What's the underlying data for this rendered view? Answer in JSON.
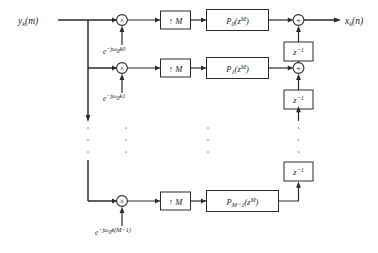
{
  "figure": {
    "type": "block-diagram",
    "domain": "signal-processing"
  },
  "signals": {
    "input_label": "yₖ(m)",
    "input_base": "y",
    "input_sub": "k",
    "input_arg": "(m)",
    "output_label": "xₖ(n)",
    "output_base": "x",
    "output_sub": "k",
    "output_arg": "(n)"
  },
  "branches": [
    {
      "index": 0,
      "modulator_symbol": "×",
      "modulator_label": "multiplier",
      "exponent_base": "e",
      "exponent_label": "−jω₀k0",
      "exp_prefix": "−jω",
      "exp_omega_sub": "0",
      "exp_suffix": "k0",
      "upsampler_label": "↑ M",
      "filter_base": "P",
      "filter_sub": "0",
      "filter_arg_base": "(z",
      "filter_arg_sup": "M",
      "filter_arg_close": ")",
      "filter_label": "P₀(zᴹ)"
    },
    {
      "index": 1,
      "modulator_symbol": "×",
      "modulator_label": "multiplier",
      "exponent_base": "e",
      "exponent_label": "−jω₀k1",
      "exp_prefix": "−jω",
      "exp_omega_sub": "0",
      "exp_suffix": "k1",
      "upsampler_label": "↑ M",
      "filter_base": "P",
      "filter_sub": "1",
      "filter_arg_base": "(z",
      "filter_arg_sup": "M",
      "filter_arg_close": ")",
      "filter_label": "P₁(zᴹ)"
    },
    {
      "index": 2,
      "modulator_symbol": "×",
      "modulator_label": "multiplier",
      "exponent_base": "e",
      "exponent_label": "−jω₀k(M−1)",
      "exp_prefix": "−jω",
      "exp_omega_sub": "0",
      "exp_suffix": "k(M−1)",
      "upsampler_label": "↑ M",
      "filter_base": "P",
      "filter_sub": "M−1",
      "filter_arg_base": "(z",
      "filter_arg_sup": "M",
      "filter_arg_close": ")",
      "filter_label": "Pₘ₋₁(zᴹ)"
    }
  ],
  "adders": [
    {
      "index": 0,
      "symbol": "+",
      "label": "summing-junction"
    },
    {
      "index": 1,
      "symbol": "+",
      "label": "summing-junction"
    }
  ],
  "delays": [
    {
      "index": 0,
      "base": "z",
      "sup": "−1",
      "label": "z⁻¹"
    },
    {
      "index": 1,
      "base": "z",
      "sup": "−1",
      "label": "z⁻¹"
    },
    {
      "index": 2,
      "base": "z",
      "sup": "−1",
      "label": "z⁻¹"
    }
  ],
  "ellipsis": {
    "symbol": "⋮",
    "columns": 4,
    "dots_per_column": 3
  },
  "colors": {
    "line": "#2b2b2b",
    "box_fill": "#ffffff",
    "text": "#1a1a1a",
    "background": "#ffffff",
    "dots": "#8a8a8a"
  }
}
